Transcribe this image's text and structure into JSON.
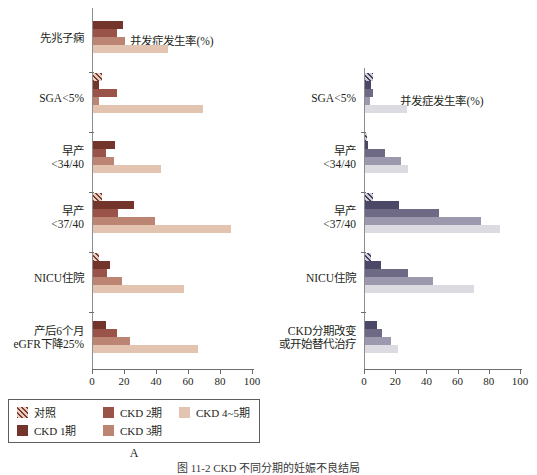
{
  "figure": {
    "caption": "图 11-2  CKD 不同分期的妊娠不良结局",
    "panels": [
      {
        "letter": "A"
      },
      {
        "letter": "B"
      }
    ]
  },
  "axis": {
    "xlabel": "并发症发生率(%)",
    "ticks": [
      0,
      20,
      40,
      60,
      80,
      100
    ],
    "tick_labels": [
      "0",
      "20",
      "40",
      "60",
      "80",
      "100"
    ]
  },
  "legend": {
    "items": [
      {
        "key": "ctrl",
        "label": "对照",
        "colorA": "#7b3b2e",
        "colorB": "#45415c",
        "hatched": true
      },
      {
        "key": "ckd1",
        "label": "CKD 1期",
        "colorA": "#73342c",
        "colorB": "#4b4766",
        "hatched": false
      },
      {
        "key": "ckd2",
        "label": "CKD 2期",
        "colorA": "#9a5349",
        "colorB": "#6e6a86",
        "hatched": false
      },
      {
        "key": "ckd3",
        "label": "CKD 3期",
        "colorA": "#bb8473",
        "colorB": "#9c98ae",
        "hatched": false
      },
      {
        "key": "ckd45",
        "label": "CKD 4~5期",
        "colorA": "#e3c4b0",
        "colorB": "#dddbe2",
        "hatched": false
      }
    ]
  },
  "chart_data": [
    {
      "panel": "A",
      "type": "bar",
      "orientation": "horizontal",
      "title": "A",
      "xlabel": "并发症发生率(%)",
      "ylabel": "",
      "xlim": [
        0,
        100
      ],
      "grid": false,
      "legend_position": "bottom",
      "categories": [
        "先兆子痫",
        "SGA<5%",
        "早产\n<34/40",
        "早产\n<37/40",
        "NICU住院",
        "产后6个月\neGFR下降25%"
      ],
      "category_lines": [
        [
          "先兆子痫"
        ],
        [
          "SGA<5%"
        ],
        [
          "早产",
          "<34/40"
        ],
        [
          "早产",
          "<37/40"
        ],
        [
          "NICU住院"
        ],
        [
          "产后6个月",
          "eGFR下降25%"
        ]
      ],
      "series": [
        {
          "name": "对照",
          "values": [
            0,
            5.5,
            0,
            5.5,
            4,
            0
          ]
        },
        {
          "name": "CKD 1期",
          "values": [
            19,
            4,
            14,
            26,
            11,
            8
          ]
        },
        {
          "name": "CKD 2期",
          "values": [
            15,
            15,
            8,
            16,
            9,
            15
          ]
        },
        {
          "name": "CKD 3期",
          "values": [
            20,
            4,
            13.5,
            39,
            18,
            23
          ]
        },
        {
          "name": "CKD 4~5期",
          "values": [
            47,
            69,
            43,
            87,
            57,
            66
          ]
        }
      ]
    },
    {
      "panel": "B",
      "type": "bar",
      "orientation": "horizontal",
      "title": "B",
      "xlabel": "并发症发生率(%)",
      "ylabel": "",
      "xlim": [
        0,
        100
      ],
      "grid": false,
      "legend_position": "bottom",
      "categories": [
        "SGA<5%",
        "早产\n<34/40",
        "早产\n<37/40",
        "NICU住院",
        "CKD分期改变\n或开始替代治疗"
      ],
      "category_lines": [
        [
          "SGA<5%"
        ],
        [
          "早产",
          "<34/40"
        ],
        [
          "早产",
          "<37/40"
        ],
        [
          "NICU住院"
        ],
        [
          "CKD分期改变",
          "或开始替代治疗"
        ]
      ],
      "series": [
        {
          "name": "对照",
          "values": [
            5,
            1.5,
            5,
            4,
            0
          ]
        },
        {
          "name": "CKD 1期",
          "values": [
            4,
            2,
            22,
            10,
            8
          ]
        },
        {
          "name": "CKD 2期",
          "values": [
            5,
            13,
            48,
            28,
            11
          ]
        },
        {
          "name": "CKD 3期",
          "values": [
            3,
            23,
            75,
            44,
            17
          ]
        },
        {
          "name": "CKD 4~5期",
          "values": [
            27,
            28,
            87,
            70,
            21
          ]
        }
      ]
    }
  ]
}
